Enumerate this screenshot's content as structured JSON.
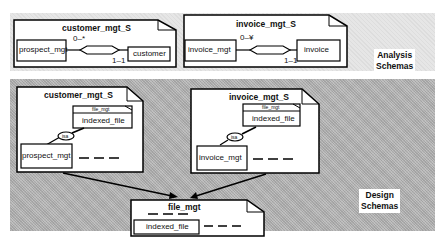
{
  "bands": {
    "analysis": {
      "label_line1": "Analysis",
      "label_line2": "Schemas"
    },
    "design": {
      "label_line1": "Design",
      "label_line2": "Schemas"
    }
  },
  "analysis": {
    "customer_schema": {
      "title": "customer_mgt_S",
      "left_entity": "prospect_mgt",
      "right_entity": "customer",
      "card_top": "0–*",
      "card_bottom": "1–1"
    },
    "invoice_schema": {
      "title": "invoice_mgt_S",
      "left_entity": "invoice_mgt",
      "right_entity": "invoice",
      "card_top": "0–¥",
      "card_bottom": "1–1"
    }
  },
  "design": {
    "customer_schema": {
      "title": "customer_mgt_S",
      "imported_header": "file_mgt",
      "imported_class": "indexed_file",
      "isa_label": "isa",
      "class": "prospect_mgt"
    },
    "invoice_schema": {
      "title": "invoice_mgt_S",
      "imported_header": "file_mgt",
      "imported_class": "indexed_file",
      "isa_label": "isa",
      "class": "invoice_mgt"
    },
    "file_schema": {
      "title": "file_mgt",
      "class": "indexed_file"
    }
  }
}
